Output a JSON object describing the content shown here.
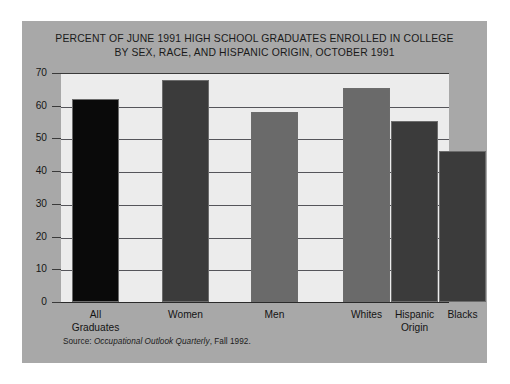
{
  "figure": {
    "title_line1": "PERCENT OF JUNE 1991 HIGH SCHOOL GRADUATES ENROLLED IN COLLEGE",
    "title_line2": "BY SEX, RACE, AND HISPANIC ORIGIN, OCTOBER 1991",
    "source_prefix": "Source: ",
    "source_italic": "Occupational Outlook Quarterly",
    "source_suffix": ", Fall 1992.",
    "panel_color": "#a8a8a8",
    "plot_bg_color": "#ececec",
    "page_bg_color": "#ffffff"
  },
  "chart_data": {
    "type": "bar",
    "title": "PERCENT OF JUNE 1991 HIGH SCHOOL GRADUATES ENROLLED IN COLLEGE BY SEX, RACE, AND HISPANIC ORIGIN, OCTOBER 1991",
    "xlabel": "",
    "ylabel": "",
    "ylim": [
      0,
      70
    ],
    "ytick_step": 10,
    "ytick_labels": [
      "70",
      "60",
      "50",
      "40",
      "30",
      "20",
      "10",
      "0"
    ],
    "ytick_values": [
      70,
      60,
      50,
      40,
      30,
      20,
      10,
      0
    ],
    "grid": true,
    "grid_axis": "y",
    "legend": false,
    "categories": [
      "All Graduates",
      "Women",
      "Men",
      "Whites",
      "Hispanic Origin",
      "Blacks"
    ],
    "category_labels": [
      "All\nGraduates",
      "Women",
      "Men",
      "Whites",
      "Hispanic\nOrigin",
      "Blacks"
    ],
    "values": [
      62.0,
      67.9,
      58.1,
      65.4,
      55.4,
      46.3
    ],
    "bar_colors": [
      "#0a0a0a",
      "#3b3b3b",
      "#6a6a6a",
      "#6a6a6a",
      "#3b3b3b",
      "#3b3b3b"
    ],
    "bar_gap_after_index": 2
  }
}
